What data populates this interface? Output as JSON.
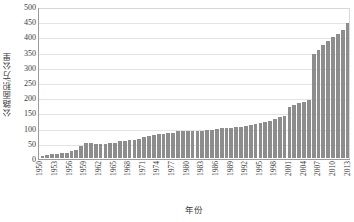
{
  "chart_data": {
    "type": "bar",
    "title": "",
    "xlabel": "年份",
    "ylabel": "公路面积/万公里",
    "ylim": [
      0,
      500
    ],
    "ytick_step": 50,
    "yticks": [
      500,
      450,
      400,
      350,
      300,
      250,
      200,
      150,
      100,
      50,
      0
    ],
    "grid": true,
    "legend": "none",
    "bar_color": "#8d8d8d",
    "axis_color": "#9a9a9a",
    "gridline_color": "#e3e3e3",
    "xtick_label_step": 3,
    "xtick_labels": [
      "1950",
      "1953",
      "1956",
      "1959",
      "1962",
      "1965",
      "1968",
      "1971",
      "1974",
      "1977",
      "1980",
      "1983",
      "1986",
      "1989",
      "1992",
      "1995",
      "1998",
      "2001",
      "2004",
      "2007",
      "2010",
      "2013"
    ],
    "categories": [
      "1950",
      "1951",
      "1952",
      "1953",
      "1954",
      "1955",
      "1956",
      "1957",
      "1958",
      "1959",
      "1960",
      "1961",
      "1962",
      "1963",
      "1964",
      "1965",
      "1966",
      "1967",
      "1968",
      "1969",
      "1970",
      "1971",
      "1972",
      "1973",
      "1974",
      "1975",
      "1976",
      "1977",
      "1978",
      "1979",
      "1980",
      "1981",
      "1982",
      "1983",
      "1984",
      "1985",
      "1986",
      "1987",
      "1988",
      "1989",
      "1990",
      "1991",
      "1992",
      "1993",
      "1994",
      "1995",
      "1996",
      "1997",
      "1998",
      "1999",
      "2000",
      "2001",
      "2002",
      "2003",
      "2004",
      "2005",
      "2006",
      "2007",
      "2008",
      "2009",
      "2010",
      "2011",
      "2012",
      "2013"
    ],
    "values": [
      8,
      9,
      13,
      14,
      15,
      17,
      22,
      25,
      40,
      50,
      51,
      46,
      46,
      48,
      51,
      51,
      55,
      56,
      58,
      59,
      64,
      68,
      72,
      75,
      78,
      78,
      82,
      84,
      89,
      88,
      89,
      90,
      91,
      91,
      92,
      94,
      96,
      98,
      100,
      101,
      103,
      104,
      105,
      108,
      112,
      116,
      119,
      123,
      128,
      135,
      140,
      170,
      176,
      181,
      187,
      193,
      346,
      358,
      373,
      386,
      401,
      410,
      424,
      446
    ]
  }
}
